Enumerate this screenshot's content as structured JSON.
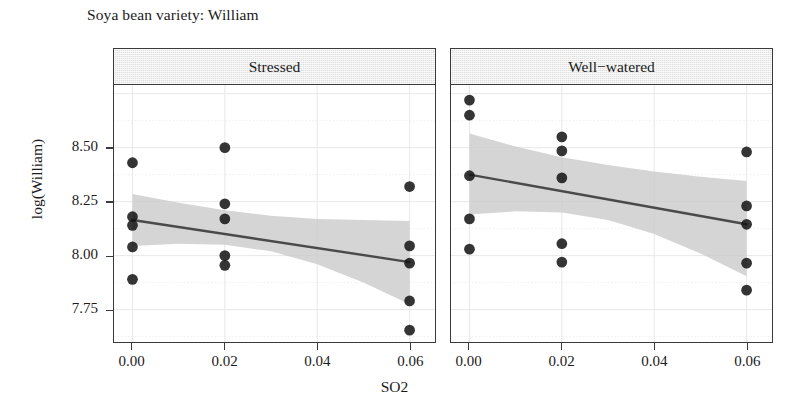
{
  "title": "Soya bean variety: William",
  "axes": {
    "xlabel": "SO2",
    "ylabel": "log(William)",
    "xticks": [
      "0.00",
      "0.02",
      "0.04",
      "0.06"
    ],
    "yticks": [
      "7.75",
      "8.00",
      "8.25",
      "8.50"
    ]
  },
  "panels": [
    {
      "id": "stressed",
      "label": "Stressed"
    },
    {
      "id": "wellwatered",
      "label": "Well−watered"
    }
  ],
  "chart_data": {
    "type": "scatter",
    "title": "Soya bean variety: William",
    "xlabel": "SO2",
    "ylabel": "log(William)",
    "xlim": [
      -0.004,
      0.0655
    ],
    "ylim": [
      7.6,
      8.79
    ],
    "xticks": [
      0.0,
      0.02,
      0.04,
      0.06
    ],
    "yticks": [
      7.75,
      8.0,
      8.25,
      8.5
    ],
    "grid": true,
    "grid_color": "#e8e8e8",
    "point_color": "#141414",
    "line_color": "#4a4a4a",
    "band_color": "#c9c9c9",
    "legend": "none",
    "facet_variable": "water treatment",
    "panels": [
      {
        "name": "Stressed",
        "points": [
          {
            "x": 0.0,
            "y": 8.43
          },
          {
            "x": 0.0,
            "y": 8.18
          },
          {
            "x": 0.0,
            "y": 8.14
          },
          {
            "x": 0.0,
            "y": 8.04
          },
          {
            "x": 0.0,
            "y": 7.89
          },
          {
            "x": 0.02,
            "y": 8.5
          },
          {
            "x": 0.02,
            "y": 8.24
          },
          {
            "x": 0.02,
            "y": 8.17
          },
          {
            "x": 0.02,
            "y": 8.0
          },
          {
            "x": 0.02,
            "y": 7.955
          },
          {
            "x": 0.06,
            "y": 8.32
          },
          {
            "x": 0.06,
            "y": 8.045
          },
          {
            "x": 0.06,
            "y": 7.965
          },
          {
            "x": 0.06,
            "y": 7.79
          },
          {
            "x": 0.06,
            "y": 7.655
          }
        ],
        "fit": {
          "x0": 0.0,
          "y0": 8.165,
          "x1": 0.06,
          "y1": 7.97
        },
        "band": {
          "x": [
            0.0,
            0.01,
            0.02,
            0.03,
            0.04,
            0.05,
            0.06
          ],
          "upper": [
            8.285,
            8.245,
            8.21,
            8.185,
            8.17,
            8.165,
            8.16
          ],
          "lower": [
            8.045,
            8.055,
            8.05,
            8.02,
            7.96,
            7.875,
            7.775
          ]
        }
      },
      {
        "name": "Well−watered",
        "points": [
          {
            "x": 0.0,
            "y": 8.72
          },
          {
            "x": 0.0,
            "y": 8.65
          },
          {
            "x": 0.0,
            "y": 8.37
          },
          {
            "x": 0.0,
            "y": 8.17
          },
          {
            "x": 0.0,
            "y": 8.03
          },
          {
            "x": 0.02,
            "y": 8.55
          },
          {
            "x": 0.02,
            "y": 8.485
          },
          {
            "x": 0.02,
            "y": 8.36
          },
          {
            "x": 0.02,
            "y": 8.055
          },
          {
            "x": 0.02,
            "y": 7.97
          },
          {
            "x": 0.06,
            "y": 8.48
          },
          {
            "x": 0.06,
            "y": 8.23
          },
          {
            "x": 0.06,
            "y": 8.145
          },
          {
            "x": 0.06,
            "y": 7.965
          },
          {
            "x": 0.06,
            "y": 7.84
          }
        ],
        "fit": {
          "x0": 0.0,
          "y0": 8.375,
          "x1": 0.06,
          "y1": 8.145
        },
        "band": {
          "x": [
            0.0,
            0.01,
            0.02,
            0.03,
            0.04,
            0.05,
            0.06
          ],
          "upper": [
            8.565,
            8.505,
            8.455,
            8.42,
            8.39,
            8.365,
            8.345
          ],
          "lower": [
            8.19,
            8.205,
            8.2,
            8.165,
            8.1,
            8.01,
            7.905
          ]
        }
      }
    ]
  }
}
